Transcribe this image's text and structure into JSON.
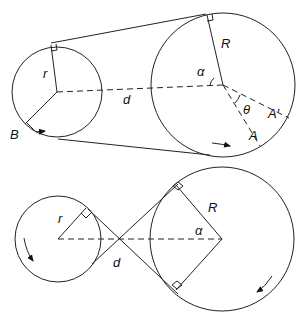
{
  "diagram": {
    "top": {
      "type": "open-belt",
      "labels": {
        "small_radius": "r",
        "large_radius": "R",
        "center_distance": "d",
        "angle_alpha": "α",
        "angle_theta": "θ",
        "point_A": "A",
        "point_A_prime": "A′",
        "point_B": "B"
      }
    },
    "bottom": {
      "type": "crossed-belt",
      "labels": {
        "small_radius": "r",
        "large_radius": "R",
        "center_distance": "d",
        "angle_alpha": "α"
      }
    },
    "colors": {
      "stroke": "#222222",
      "background": "#ffffff"
    }
  }
}
